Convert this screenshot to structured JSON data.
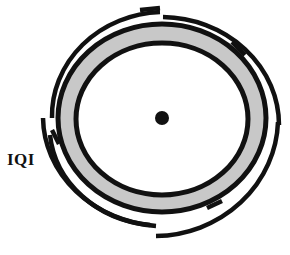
{
  "title": "",
  "labels": {
    "iqi": "IQI"
  },
  "colors": {
    "stroke": "#111111",
    "ring_fill": "#c8c8c8",
    "background": "#ffffff"
  },
  "elements": {
    "center_dot": {
      "cx": 162,
      "cy": 118,
      "r": 7
    },
    "inner_ellipse": {
      "cx": 162,
      "cy": 119,
      "rx": 86,
      "ry": 76
    },
    "outer_ellipse": {
      "cx": 162,
      "cy": 118,
      "rx": 104,
      "ry": 94
    },
    "iqi_markers": [
      "top-right",
      "left",
      "bottom"
    ],
    "outer_arc_segments": 6
  }
}
